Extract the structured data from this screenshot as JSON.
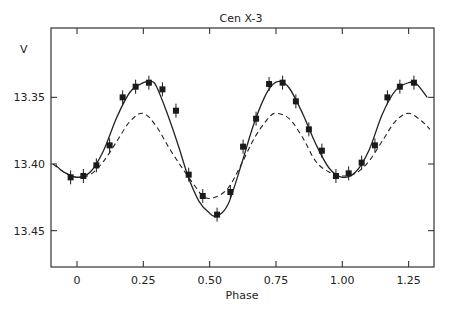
{
  "chart_data": {
    "type": "scatter",
    "title": "Cen X-3",
    "xlabel": "Phase",
    "ylabel": "V",
    "xlim": [
      -0.1,
      1.34
    ],
    "ylim": [
      13.476,
      13.298
    ],
    "y_inverted": true,
    "grid": false,
    "legend": null,
    "x_ticks": [
      0,
      0.25,
      0.5,
      0.75,
      1.0,
      1.25
    ],
    "x_tick_labels": [
      "0",
      "0.25",
      "0.50",
      "0.75",
      "1.00",
      "1.25"
    ],
    "y_ticks": [
      13.35,
      13.4,
      13.45
    ],
    "y_tick_labels": [
      "13.35",
      "13.40",
      "13.45"
    ],
    "series": [
      {
        "name": "observations",
        "style": "square markers with vertical error bars",
        "error": 0.005,
        "x": [
          -0.024,
          0.024,
          0.073,
          0.123,
          0.172,
          0.221,
          0.271,
          0.322,
          0.373,
          0.421,
          0.474,
          0.528,
          0.578,
          0.626,
          0.675,
          0.724,
          0.775,
          0.825,
          0.874,
          0.923,
          0.976,
          1.024,
          1.073,
          1.123,
          1.17,
          1.217,
          1.27
        ],
        "y": [
          13.41,
          13.409,
          13.401,
          13.386,
          13.35,
          13.342,
          13.339,
          13.344,
          13.36,
          13.408,
          13.424,
          13.438,
          13.421,
          13.387,
          13.366,
          13.34,
          13.339,
          13.353,
          13.374,
          13.39,
          13.409,
          13.407,
          13.399,
          13.386,
          13.35,
          13.342,
          13.339
        ]
      },
      {
        "name": "model fit (solid)",
        "style": "solid line",
        "x": [
          -0.08,
          -0.05,
          0.0,
          0.05,
          0.1,
          0.15,
          0.2,
          0.25,
          0.28,
          0.3,
          0.34,
          0.38,
          0.42,
          0.46,
          0.5,
          0.53,
          0.57,
          0.62,
          0.67,
          0.72,
          0.76,
          0.8,
          0.85,
          0.9,
          0.95,
          1.0,
          1.05,
          1.1,
          1.15,
          1.2,
          1.25,
          1.28,
          1.32
        ],
        "y": [
          13.401,
          13.406,
          13.41,
          13.406,
          13.39,
          13.365,
          13.346,
          13.339,
          13.338,
          13.342,
          13.362,
          13.385,
          13.41,
          13.428,
          13.437,
          13.439,
          13.43,
          13.4,
          13.368,
          13.345,
          13.338,
          13.343,
          13.362,
          13.385,
          13.403,
          13.41,
          13.406,
          13.39,
          13.363,
          13.345,
          13.339,
          13.34,
          13.35
        ]
      },
      {
        "name": "model (dashed)",
        "style": "dashed line",
        "x": [
          -0.09,
          -0.05,
          0.0,
          0.05,
          0.1,
          0.15,
          0.2,
          0.25,
          0.3,
          0.35,
          0.4,
          0.45,
          0.48,
          0.52,
          0.57,
          0.62,
          0.67,
          0.72,
          0.75,
          0.8,
          0.85,
          0.9,
          0.95,
          1.0,
          1.05,
          1.1,
          1.15,
          1.2,
          1.25,
          1.3,
          1.33
        ],
        "y": [
          13.4,
          13.406,
          13.41,
          13.408,
          13.398,
          13.383,
          13.368,
          13.362,
          13.372,
          13.389,
          13.404,
          13.418,
          13.425,
          13.425,
          13.418,
          13.4,
          13.38,
          13.366,
          13.362,
          13.366,
          13.38,
          13.398,
          13.406,
          13.409,
          13.407,
          13.398,
          13.383,
          13.368,
          13.362,
          13.368,
          13.374
        ]
      }
    ]
  }
}
